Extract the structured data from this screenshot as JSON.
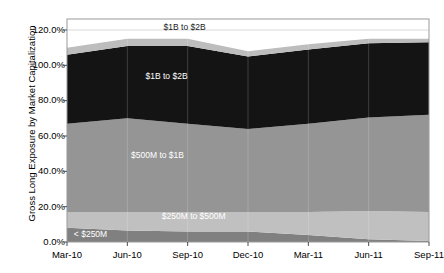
{
  "chart_data": {
    "type": "area",
    "stacked": true,
    "title": "",
    "xlabel": "",
    "ylabel": "Gross Long Exposure by Market Capitalization",
    "x": [
      "Mar-10",
      "Jun-10",
      "Sep-10",
      "Dec-10",
      "Mar-11",
      "Jun-11",
      "Sep-11"
    ],
    "categories": [
      "Mar-10",
      "Jun-10",
      "Sep-10",
      "Dec-10",
      "Mar-11",
      "Jun-11",
      "Sep-11"
    ],
    "ylim": [
      0,
      120
    ],
    "ytick_labels": [
      "0.0%",
      "20.0%",
      "40.0%",
      "60.0%",
      "80.0%",
      "100.0%",
      "120.0%"
    ],
    "ytick_values": [
      0,
      20,
      40,
      60,
      80,
      100,
      120
    ],
    "grid": true,
    "legend_position": "inline-annotations",
    "series": [
      {
        "name": "< $250M",
        "color": "#808080",
        "values": [
          8.0,
          6.5,
          6.0,
          6.0,
          4.0,
          1.5,
          0.5
        ]
      },
      {
        "name": "$250M to $500M",
        "color": "#c0c0c0",
        "values": [
          9.0,
          10.5,
          11.0,
          11.0,
          13.0,
          16.0,
          16.5
        ]
      },
      {
        "name": "$500M to $1B",
        "color": "#959595",
        "values": [
          50.0,
          53.0,
          50.0,
          47.0,
          50.0,
          53.0,
          55.0
        ]
      },
      {
        "name": "$1B to $2B",
        "color": "#141414",
        "values": [
          39.0,
          41.0,
          44.0,
          41.0,
          42.0,
          42.0,
          41.0
        ]
      },
      {
        "name": "$1B to $2B",
        "color": "#bdbdbd",
        "values": [
          4.0,
          4.0,
          4.0,
          3.0,
          3.0,
          2.5,
          2.0
        ]
      }
    ],
    "annotations": [
      {
        "text": "$1B to $2B",
        "x_frac": 0.325,
        "y_pct": 121.5,
        "style": "light"
      },
      {
        "text": "$1B to $2B",
        "x_frac": 0.275,
        "y_pct": 94.0,
        "style": "dark"
      },
      {
        "text": "$500M to $1B",
        "x_frac": 0.25,
        "y_pct": 49.5,
        "style": "dark"
      },
      {
        "text": "$250M to $500M",
        "x_frac": 0.35,
        "y_pct": 14.5,
        "style": "dark"
      },
      {
        "text": "< $250M",
        "x_frac": 0.065,
        "y_pct": 4.5,
        "style": "dark"
      }
    ]
  },
  "axis": {
    "y_title": "Gross Long Exposure by Market Capitalization",
    "y_ticks": [
      "120.0%",
      "100.0%",
      "80.0%",
      "60.0%",
      "40.0%",
      "20.0%",
      "0.0%"
    ],
    "x_ticks": [
      "Mar-10",
      "Jun-10",
      "Sep-10",
      "Dec-10",
      "Mar-11",
      "Jun-11",
      "Sep-11"
    ]
  },
  "colors": {
    "plot_border": "#9a9a9a",
    "gridline": "#d9d9d9",
    "background": "#ffffff",
    "band_lt250m": "#808080",
    "band_250m_500m": "#c0c0c0",
    "band_500m_1b": "#959595",
    "band_1b_2b": "#141414",
    "band_top": "#bdbdbd"
  }
}
